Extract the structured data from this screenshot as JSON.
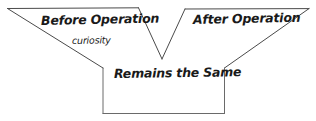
{
  "diagram": {
    "type": "hand-drawn-comparison-funnel",
    "background_color": "#ffffff",
    "stroke_color": "#4a4a4a",
    "text_color": "#1a1a1a",
    "labels": {
      "left_wing": "Before Operation",
      "right_wing": "After Operation",
      "left_wing_sub": "curiosity",
      "bottom_box": "Remains the Same"
    },
    "outline_path": "M 7 8 L 139 8 L 162 59 L 185 9 L 309 9 L 224 68 L 224 113 L 103 113 L 103 68 Z",
    "geometry": {
      "left_wing_top_left": [
        7,
        8
      ],
      "left_wing_top_right": [
        139,
        8
      ],
      "notch_vertex": [
        162,
        59
      ],
      "right_wing_top_left": [
        185,
        9
      ],
      "right_wing_top_right": [
        309,
        9
      ],
      "box_top_right": [
        224,
        68
      ],
      "box_bottom_right": [
        224,
        113
      ],
      "box_bottom_left": [
        103,
        113
      ],
      "box_top_left": [
        103,
        68
      ]
    }
  }
}
